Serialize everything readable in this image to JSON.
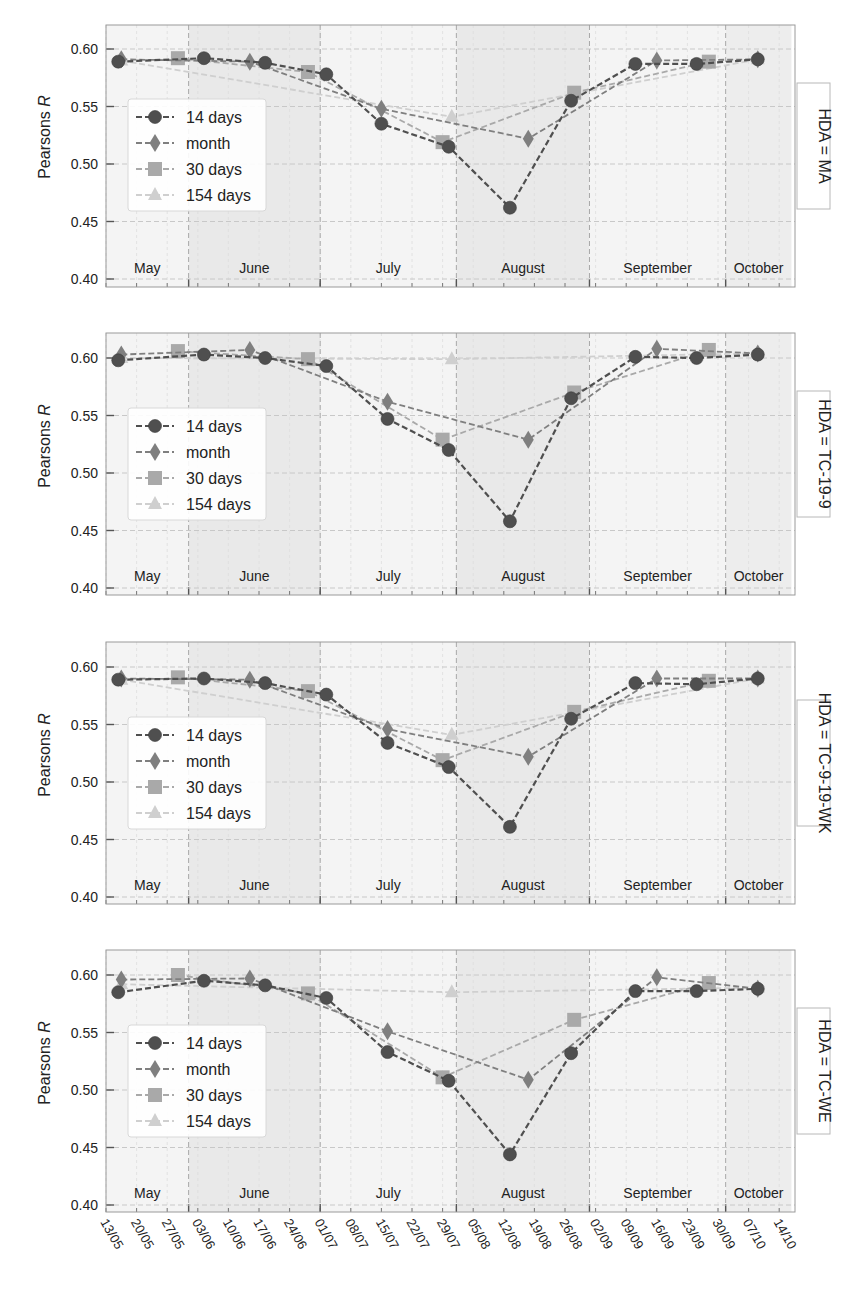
{
  "figure": {
    "ylabel": "Pearsons R",
    "xtick_labels": [
      "13/05",
      "20/05",
      "27/05",
      "03/06",
      "10/06",
      "17/06",
      "24/06",
      "01/07",
      "08/07",
      "15/07",
      "22/07",
      "29/07",
      "05/08",
      "12/08",
      "19/08",
      "26/08",
      "02/09",
      "09/09",
      "16/09",
      "23/09",
      "30/09",
      "07/10",
      "14/10"
    ],
    "months": [
      {
        "label": "May",
        "start": -0.1,
        "end": 2.7,
        "shade": "#f4f4f4"
      },
      {
        "label": "June",
        "start": 2.7,
        "end": 7.0,
        "shade": "#e9e9e9"
      },
      {
        "label": "July",
        "start": 7.0,
        "end": 11.45,
        "shade": "#f4f4f4"
      },
      {
        "label": "August",
        "start": 11.45,
        "end": 15.8,
        "shade": "#e9e9e9"
      },
      {
        "label": "September",
        "start": 15.8,
        "end": 20.25,
        "shade": "#f4f4f4"
      },
      {
        "label": "October",
        "start": 20.25,
        "end": 22.4,
        "shade": "#ededed"
      }
    ],
    "yticks": [
      0.4,
      0.45,
      0.5,
      0.55,
      0.6
    ],
    "ylim": [
      0.398,
      0.622
    ],
    "legend": [
      "14 days",
      "month",
      "30 days",
      "154 days"
    ]
  },
  "colors": {
    "14 days": "#4f4f4f",
    "month": "#7f7f7f",
    "30 days": "#a9a9a9",
    "154 days": "#cfcfcf",
    "grid": "#c8c8c8",
    "axis": "#9a9a9a",
    "text": "#222222"
  },
  "chart_data": [
    {
      "type": "line",
      "panel_label": "HDA = MA",
      "xlabel": "",
      "ylabel": "Pearsons R",
      "ylim": [
        0.4,
        0.62
      ],
      "x_categories": [
        "13/05",
        "20/05",
        "27/05",
        "03/06",
        "10/06",
        "17/06",
        "24/06",
        "01/07",
        "08/07",
        "15/07",
        "22/07",
        "29/07",
        "05/08",
        "12/08",
        "19/08",
        "26/08",
        "02/09",
        "09/09",
        "16/09",
        "23/09",
        "30/09",
        "07/10",
        "14/10"
      ],
      "series": [
        {
          "name": "14 days",
          "marker": "circle",
          "x": [
            0.4,
            3.2,
            5.2,
            7.2,
            9.0,
            11.2,
            13.2,
            15.2,
            17.3,
            19.3,
            21.3
          ],
          "values": [
            0.589,
            0.592,
            0.588,
            0.578,
            0.535,
            0.515,
            0.462,
            0.555,
            0.587,
            0.587,
            0.591
          ]
        },
        {
          "name": "month",
          "marker": "diamond",
          "x": [
            0.5,
            4.7,
            9.0,
            13.8,
            18.0,
            21.3
          ],
          "values": [
            0.591,
            0.589,
            0.548,
            0.522,
            0.59,
            0.591
          ]
        },
        {
          "name": "30 days",
          "marker": "square",
          "x": [
            2.35,
            6.6,
            11.0,
            15.3,
            19.7
          ],
          "values": [
            0.592,
            0.58,
            0.519,
            0.562,
            0.589
          ]
        },
        {
          "name": "154 days",
          "marker": "triangle",
          "x": [
            0.5,
            11.3,
            21.3
          ],
          "values": [
            0.59,
            0.541,
            0.591
          ]
        }
      ]
    },
    {
      "type": "line",
      "panel_label": "HDA = TC-19-9",
      "xlabel": "",
      "ylabel": "Pearsons R",
      "ylim": [
        0.4,
        0.62
      ],
      "series": [
        {
          "name": "14 days",
          "marker": "circle",
          "x": [
            0.4,
            3.2,
            5.2,
            7.2,
            9.2,
            11.2,
            13.2,
            15.2,
            17.3,
            19.3,
            21.3
          ],
          "values": [
            0.598,
            0.603,
            0.6,
            0.593,
            0.547,
            0.52,
            0.458,
            0.565,
            0.601,
            0.6,
            0.603
          ]
        },
        {
          "name": "month",
          "marker": "diamond",
          "x": [
            0.5,
            4.7,
            9.2,
            13.8,
            18.0,
            21.3
          ],
          "values": [
            0.603,
            0.607,
            0.562,
            0.529,
            0.608,
            0.604
          ]
        },
        {
          "name": "30 days",
          "marker": "square",
          "x": [
            2.35,
            6.6,
            11.0,
            15.3,
            19.7
          ],
          "values": [
            0.606,
            0.599,
            0.529,
            0.57,
            0.607
          ]
        },
        {
          "name": "154 days",
          "marker": "triangle",
          "x": [
            0.5,
            11.3,
            21.3
          ],
          "values": [
            0.6,
            0.599,
            0.604
          ]
        }
      ]
    },
    {
      "type": "line",
      "panel_label": "HDA = TC-9-19-WK",
      "xlabel": "",
      "ylabel": "Pearsons R",
      "ylim": [
        0.4,
        0.62
      ],
      "series": [
        {
          "name": "14 days",
          "marker": "circle",
          "x": [
            0.4,
            3.2,
            5.2,
            7.2,
            9.2,
            11.2,
            13.2,
            15.2,
            17.3,
            19.3,
            21.3
          ],
          "values": [
            0.589,
            0.59,
            0.586,
            0.576,
            0.534,
            0.513,
            0.461,
            0.555,
            0.586,
            0.585,
            0.59
          ]
        },
        {
          "name": "month",
          "marker": "diamond",
          "x": [
            0.5,
            4.7,
            9.2,
            13.8,
            18.0,
            21.3
          ],
          "values": [
            0.59,
            0.589,
            0.546,
            0.522,
            0.59,
            0.59
          ]
        },
        {
          "name": "30 days",
          "marker": "square",
          "x": [
            2.35,
            6.6,
            11.0,
            15.3,
            19.7
          ],
          "values": [
            0.591,
            0.579,
            0.519,
            0.561,
            0.588
          ]
        },
        {
          "name": "154 days",
          "marker": "triangle",
          "x": [
            0.5,
            11.3,
            21.3
          ],
          "values": [
            0.589,
            0.541,
            0.59
          ]
        }
      ]
    },
    {
      "type": "line",
      "panel_label": "HDA = TC-WE",
      "xlabel": "",
      "ylabel": "Pearsons R",
      "ylim": [
        0.4,
        0.62
      ],
      "series": [
        {
          "name": "14 days",
          "marker": "circle",
          "x": [
            0.4,
            3.2,
            5.2,
            7.2,
            9.2,
            11.2,
            13.2,
            15.2,
            17.3,
            19.3,
            21.3
          ],
          "values": [
            0.585,
            0.595,
            0.591,
            0.58,
            0.533,
            0.508,
            0.444,
            0.532,
            0.586,
            0.586,
            0.588
          ]
        },
        {
          "name": "month",
          "marker": "diamond",
          "x": [
            0.5,
            4.7,
            9.2,
            13.8,
            18.0,
            21.3
          ],
          "values": [
            0.596,
            0.597,
            0.551,
            0.509,
            0.598,
            0.588
          ]
        },
        {
          "name": "30 days",
          "marker": "square",
          "x": [
            2.35,
            6.6,
            11.0,
            15.3,
            19.7
          ],
          "values": [
            0.6,
            0.584,
            0.511,
            0.561,
            0.593
          ]
        },
        {
          "name": "154 days",
          "marker": "triangle",
          "x": [
            0.5,
            11.3,
            21.3
          ],
          "values": [
            0.592,
            0.585,
            0.589
          ]
        }
      ]
    }
  ]
}
